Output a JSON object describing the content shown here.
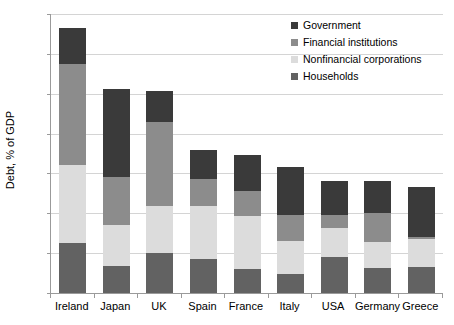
{
  "chart_data": {
    "type": "bar",
    "subtype": "stacked-bar",
    "title": "",
    "xlabel": "",
    "ylabel": "Debt, % of GDP",
    "ylim": [
      0,
      700
    ],
    "ytick_step": 100,
    "yticks": [
      0,
      100,
      200,
      300,
      400,
      500,
      600,
      700
    ],
    "grid": true,
    "legend_position": "top-right",
    "categories": [
      "Ireland",
      "Japan",
      "UK",
      "Spain",
      "France",
      "Italy",
      "USA",
      "Germany",
      "Greece"
    ],
    "series": [
      {
        "name": "Households",
        "color": "#626262",
        "values": [
          125,
          68,
          100,
          85,
          60,
          48,
          90,
          63,
          65
        ]
      },
      {
        "name": "Nonfinancial corporations",
        "color": "#dcdcdc",
        "values": [
          195,
          102,
          119,
          133,
          133,
          82,
          73,
          64,
          70
        ]
      },
      {
        "name": "Financial institutions",
        "color": "#8c8c8c",
        "values": [
          255,
          120,
          209,
          67,
          63,
          66,
          34,
          75,
          5
        ]
      },
      {
        "name": "Government",
        "color": "#3a3a3a",
        "values": [
          90,
          223,
          79,
          75,
          90,
          119,
          84,
          79,
          125
        ]
      }
    ],
    "totals": [
      665,
      513,
      507,
      360,
      346,
      315,
      281,
      281,
      265
    ],
    "legend_order": [
      "Government",
      "Financial institutions",
      "Nonfinancial corporations",
      "Households"
    ]
  },
  "colors": {
    "government": "#3a3a3a",
    "financial_institutions": "#8c8c8c",
    "nonfinancial_corporations": "#dcdcdc",
    "households": "#626262",
    "gridline": "#d4d4d4",
    "axis": "#9a9a9a",
    "background": "#ffffff",
    "text": "#000000"
  }
}
